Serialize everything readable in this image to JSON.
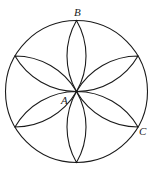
{
  "diagram": {
    "type": "geometry-figure",
    "stroke_color": "#1a1a1a",
    "circle": {
      "cx": 76.5,
      "cy": 91.5,
      "r": 71
    },
    "petal_count": 6,
    "labels": [
      {
        "id": "B",
        "text": "B",
        "x": 74,
        "y": 16
      },
      {
        "id": "A",
        "text": "A",
        "x": 61,
        "y": 104
      },
      {
        "id": "C",
        "text": "C",
        "x": 139,
        "y": 135
      }
    ]
  }
}
